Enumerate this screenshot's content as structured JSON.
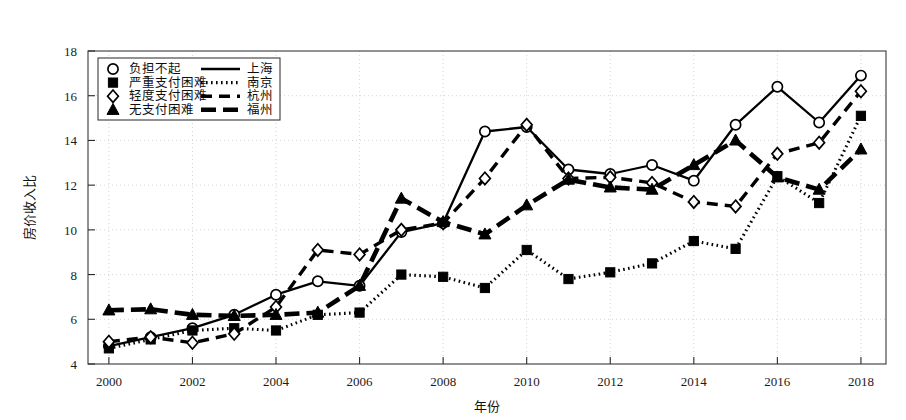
{
  "chart_data": {
    "type": "line",
    "title": "",
    "xlabel": "年份",
    "ylabel": "房价收入比",
    "xlim": [
      1999.5,
      2018.6
    ],
    "ylim": [
      4,
      18
    ],
    "xticks": [
      2000,
      2002,
      2004,
      2006,
      2008,
      2010,
      2012,
      2014,
      2016,
      2018
    ],
    "yticks": [
      4,
      6,
      8,
      10,
      12,
      14,
      16,
      18
    ],
    "grid": true,
    "grid_style": "dotted",
    "legend_position": "top-left inside",
    "x": [
      2000,
      2001,
      2002,
      2003,
      2004,
      2005,
      2006,
      2007,
      2008,
      2009,
      2010,
      2011,
      2012,
      2013,
      2014,
      2015,
      2016,
      2017,
      2018
    ],
    "series": [
      {
        "name": "上海",
        "marker": "circle-open",
        "marker_label": "负担不起",
        "line": "solid",
        "line_label": "———",
        "color": "#000000",
        "values": [
          4.8,
          5.2,
          5.6,
          6.2,
          7.1,
          7.7,
          7.5,
          9.9,
          10.3,
          14.4,
          14.6,
          12.7,
          12.5,
          12.9,
          12.2,
          14.7,
          16.4,
          14.8,
          16.9
        ]
      },
      {
        "name": "南京",
        "marker": "square-filled",
        "marker_label": "严重支付困难",
        "line": "dotted",
        "line_label": "·······",
        "color": "#000000",
        "values": [
          4.7,
          5.1,
          5.5,
          5.6,
          5.5,
          6.2,
          6.3,
          8.0,
          7.9,
          7.4,
          9.1,
          7.8,
          8.1,
          8.5,
          9.5,
          9.15,
          12.4,
          11.2,
          15.1
        ]
      },
      {
        "name": "杭州",
        "marker": "diamond-open",
        "marker_label": "轻度支付困难",
        "line": "dashed",
        "line_label": "—  —",
        "color": "#000000",
        "values": [
          5.0,
          5.2,
          4.95,
          5.35,
          6.55,
          9.1,
          8.9,
          10.0,
          10.3,
          12.3,
          14.7,
          12.3,
          12.35,
          12.1,
          11.25,
          11.05,
          13.4,
          13.9,
          16.2
        ]
      },
      {
        "name": "福州",
        "marker": "triangle-filled",
        "marker_label": "无支付困难",
        "line": "thick-dash",
        "line_label": "▬▬▬",
        "color": "#000000",
        "values": [
          6.4,
          6.45,
          6.2,
          6.15,
          6.2,
          6.3,
          7.5,
          11.4,
          10.35,
          9.8,
          11.1,
          12.25,
          11.9,
          11.8,
          12.9,
          14.0,
          12.35,
          11.8,
          13.6
        ]
      }
    ],
    "legend": [
      {
        "marker_label": "负担不起",
        "line_label": "———",
        "series": "上海"
      },
      {
        "marker_label": "严重支付困难",
        "line_label": "·······",
        "series": "南京"
      },
      {
        "marker_label": "轻度支付困难",
        "line_label": "—  —",
        "series": "杭州"
      },
      {
        "marker_label": "无支付困难",
        "line_label": "▬▬▬",
        "series": "福州"
      }
    ]
  }
}
